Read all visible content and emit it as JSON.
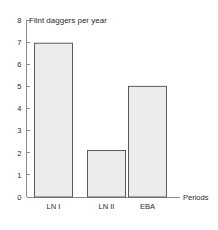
{
  "chart_data": {
    "type": "bar",
    "title": "Flint daggers per year",
    "xlabel": "Periods",
    "ylabel": "",
    "categories": [
      "LN I",
      "LN II",
      "EBA"
    ],
    "values": [
      6.95,
      2.1,
      5.0
    ],
    "ylim": [
      0,
      8
    ],
    "yticks": [
      "0",
      "1",
      "2",
      "3",
      "4",
      "5",
      "6",
      "7",
      "8"
    ],
    "ytick_values": [
      0,
      1,
      2,
      3,
      4,
      5,
      6,
      7,
      8
    ],
    "grid": false,
    "legend": null,
    "bar_fill_color": "#ececec",
    "bar_border_color": "#5a5a5a",
    "axis_color": "#8c8c8c",
    "text_color": "#2b2b2b",
    "background_color": "#ffffff"
  }
}
